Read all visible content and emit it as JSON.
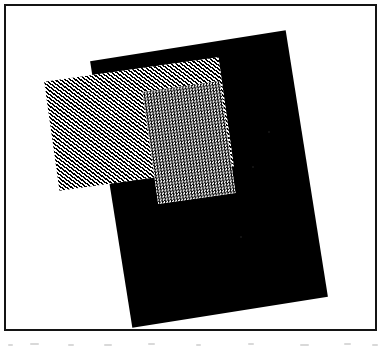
{
  "figure": {
    "canvas": {
      "width": 391,
      "height": 349,
      "background_color": "#ffffff"
    },
    "frame": {
      "name": "figure border",
      "stroke_color": "#141414",
      "stroke_width": 2,
      "x": 4,
      "y": 4,
      "width": 373,
      "height": 327
    },
    "shapes": [
      {
        "id": "solid-rect",
        "label": "solid black rectangle",
        "fill": "solid",
        "fill_color": "#000000",
        "rotation_deg": -9,
        "x": 110,
        "y": 44,
        "width": 198,
        "height": 270,
        "corners": [
          [
            186,
            41
          ],
          [
            337,
            100
          ],
          [
            268,
            318
          ],
          [
            108,
            265
          ]
        ]
      },
      {
        "id": "hatch-rect",
        "label": "diagonally hatched rectangle",
        "fill": "hatch",
        "fill_color": "#000000",
        "hatch_angle_deg": 45,
        "hatch_spacing_px": 3,
        "rotation_deg": -8,
        "x": 51,
        "y": 69,
        "width": 176,
        "height": 110,
        "corners": [
          [
            68,
            70
          ],
          [
            227,
            93
          ],
          [
            212,
            199
          ],
          [
            50,
            176
          ]
        ]
      },
      {
        "id": "overlap-rect",
        "label": "intersection stipple region",
        "fill": "stipple",
        "fill_color": "#7a7a7a",
        "stipple_size_px": 3,
        "rotation_deg": -8,
        "x": 150,
        "y": 86,
        "width": 78,
        "height": 113,
        "corners": [
          [
            157,
            88
          ],
          [
            227,
            93
          ],
          [
            219,
            199
          ],
          [
            149,
            190
          ]
        ]
      }
    ],
    "colors": {
      "ink": "#000000",
      "paper": "#ffffff",
      "frame": "#141414",
      "stipple_mean": "#7a7a7a"
    },
    "speckles": [
      {
        "x": 268,
        "y": 131,
        "size": 2
      },
      {
        "x": 252,
        "y": 166,
        "size": 2
      },
      {
        "x": 240,
        "y": 236,
        "size": 2
      }
    ],
    "scan_noise": [
      {
        "x": 8,
        "y": 344,
        "width": 5
      },
      {
        "x": 30,
        "y": 343,
        "width": 9
      },
      {
        "x": 68,
        "y": 344,
        "width": 6
      },
      {
        "x": 104,
        "y": 344,
        "width": 8
      },
      {
        "x": 148,
        "y": 343,
        "width": 7
      },
      {
        "x": 196,
        "y": 344,
        "width": 5
      },
      {
        "x": 248,
        "y": 343,
        "width": 6
      },
      {
        "x": 300,
        "y": 344,
        "width": 9
      },
      {
        "x": 344,
        "y": 343,
        "width": 7
      },
      {
        "x": 372,
        "y": 344,
        "width": 6
      }
    ]
  }
}
